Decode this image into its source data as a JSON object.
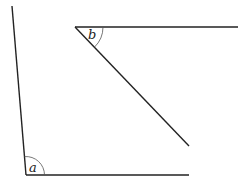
{
  "diagram": {
    "type": "angle-figure",
    "angles": [
      {
        "label": "a",
        "vertex": [
          26,
          175
        ],
        "rays": [
          [
            12,
            6
          ],
          [
            189,
            175
          ]
        ],
        "arc_radius": 18
      },
      {
        "label": "b",
        "vertex": [
          75,
          27
        ],
        "rays": [
          [
            238,
            27
          ],
          [
            189,
            146
          ]
        ],
        "arc_radius": 28
      }
    ],
    "colors": {
      "line": "#222222",
      "arc": "#555555",
      "background": "#ffffff"
    }
  }
}
